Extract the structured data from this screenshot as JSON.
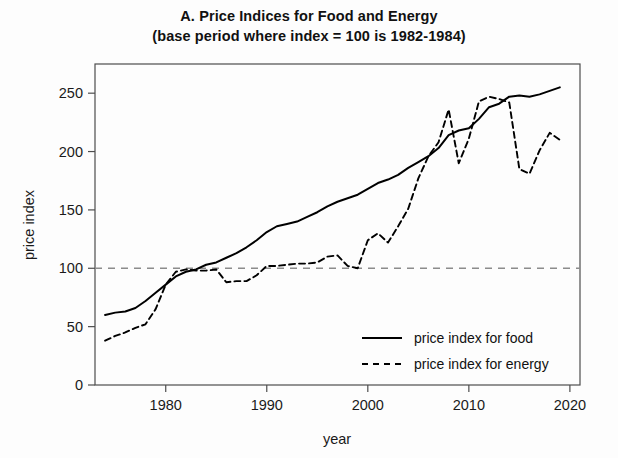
{
  "chart_data": {
    "type": "line",
    "title": "A. Price Indices for Food and Energy",
    "subtitle": "(base period where index = 100 is 1982-1984)",
    "xlabel": "year",
    "ylabel": "price index",
    "xlim": [
      1973,
      2021
    ],
    "ylim": [
      0,
      275
    ],
    "xticks": [
      1980,
      1990,
      2000,
      2010,
      2020
    ],
    "xticklabels": [
      "1980",
      "1990",
      "2000",
      "2010",
      "2020"
    ],
    "yticks": [
      0,
      50,
      100,
      150,
      200,
      250
    ],
    "yticklabels": [
      "0",
      "50",
      "100",
      "150",
      "200",
      "250"
    ],
    "grid": false,
    "reference_line": {
      "value": 100,
      "style": "dashed",
      "color": "#8c8c8c",
      "label": "base period index = 100"
    },
    "legend": {
      "position": "bottom-right",
      "entries": [
        {
          "name": "price index for food",
          "style": "solid",
          "color": "#000000"
        },
        {
          "name": "price index for energy",
          "style": "dashed",
          "color": "#000000"
        }
      ]
    },
    "series": [
      {
        "name": "price index for food",
        "style": "solid",
        "color": "#000000",
        "x": [
          1974,
          1975,
          1976,
          1977,
          1978,
          1979,
          1980,
          1981,
          1982,
          1983,
          1984,
          1985,
          1986,
          1987,
          1988,
          1989,
          1990,
          1991,
          1992,
          1993,
          1994,
          1995,
          1996,
          1997,
          1998,
          1999,
          2000,
          2001,
          2002,
          2003,
          2004,
          2005,
          2006,
          2007,
          2008,
          2009,
          2010,
          2011,
          2012,
          2013,
          2014,
          2015,
          2016,
          2017,
          2018,
          2019
        ],
        "y": [
          60,
          62,
          63,
          66,
          72,
          79,
          86,
          93,
          97,
          99,
          103,
          105,
          109,
          113,
          118,
          124,
          131,
          136,
          138,
          140,
          144,
          148,
          153,
          157,
          160,
          163,
          168,
          173,
          176,
          180,
          186,
          191,
          196,
          203,
          214,
          218,
          220,
          228,
          238,
          241,
          247,
          248,
          247,
          249,
          252,
          255
        ]
      },
      {
        "name": "price index for energy",
        "style": "dashed",
        "color": "#000000",
        "x": [
          1974,
          1975,
          1976,
          1977,
          1978,
          1979,
          1980,
          1981,
          1982,
          1983,
          1984,
          1985,
          1986,
          1987,
          1988,
          1989,
          1990,
          1991,
          1992,
          1993,
          1994,
          1995,
          1996,
          1997,
          1998,
          1999,
          2000,
          2001,
          2002,
          2003,
          2004,
          2005,
          2006,
          2007,
          2008,
          2009,
          2010,
          2011,
          2012,
          2013,
          2014,
          2015,
          2016,
          2017,
          2018,
          2019
        ],
        "y": [
          38,
          42,
          45,
          49,
          52,
          65,
          86,
          97,
          99,
          98,
          98,
          99,
          88,
          89,
          89,
          94,
          102,
          102,
          103,
          104,
          104,
          105,
          110,
          111,
          102,
          100,
          124,
          130,
          122,
          136,
          151,
          177,
          196,
          208,
          236,
          190,
          211,
          243,
          247,
          245,
          242,
          185,
          181,
          201,
          216,
          210
        ]
      }
    ],
    "annotations": [
      {
        "text": "energy spike peak",
        "x": 2008,
        "y": 271
      },
      {
        "text": "energy trough",
        "x": 2016,
        "y": 179
      }
    ]
  },
  "axes": {
    "y_title": "price index",
    "x_title": "year"
  }
}
